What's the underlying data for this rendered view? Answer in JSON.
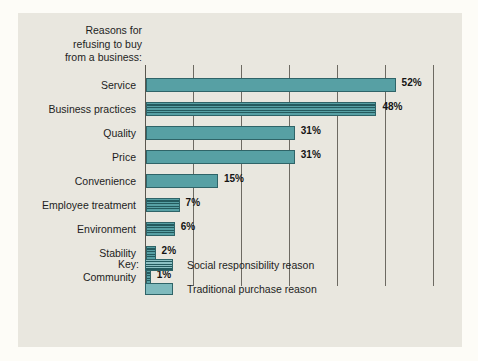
{
  "chart_data": {
    "type": "bar",
    "orientation": "horizontal",
    "title": "Reasons for\nrefusing to buy\nfrom a business:",
    "xlabel": "",
    "ylabel": "",
    "xlim": [
      0,
      62
    ],
    "grid": true,
    "gridline_step": 10,
    "value_suffix": "%",
    "categories": [
      "Service",
      "Business practices",
      "Quality",
      "Price",
      "Convenience",
      "Employee treatment",
      "Environment",
      "Stability",
      "Community"
    ],
    "values": [
      52,
      48,
      31,
      31,
      15,
      7,
      6,
      2,
      1
    ],
    "value_labels": [
      "52%",
      "48%",
      "31%",
      "31%",
      "15%",
      "7%",
      "6%",
      "2%",
      "1%"
    ],
    "bar_types": [
      "traditional",
      "social",
      "traditional",
      "traditional",
      "traditional",
      "social",
      "social",
      "social",
      "social"
    ],
    "legend": {
      "position": "bottom",
      "title": "Key:",
      "entries": [
        {
          "pattern": "striped",
          "label": "Social responsibility reason"
        },
        {
          "pattern": "solid",
          "label": "Traditional purchase reason"
        }
      ]
    },
    "colors": {
      "bar_fill": "#57a0a4",
      "bar_stripe": "#245a5e",
      "bar_border": "#2f6468",
      "panel_background": "#e9e7df",
      "page_background": "#fdfcf7",
      "gridline": "#6d6a62",
      "text": "#1d1d1d"
    }
  }
}
